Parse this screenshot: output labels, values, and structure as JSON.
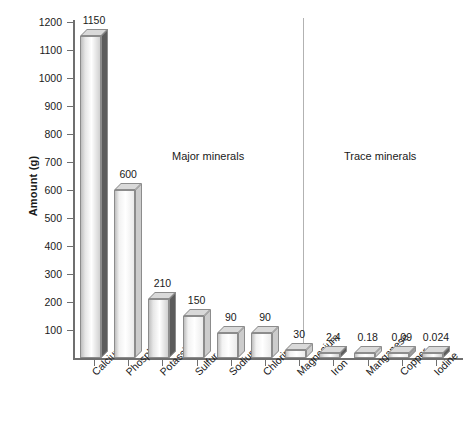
{
  "chart_data": {
    "type": "bar",
    "title": "",
    "subtitle": "",
    "xlabel": "",
    "ylabel": "Amount (g)",
    "ylim": [
      0,
      1200
    ],
    "yticks": [
      100,
      200,
      300,
      400,
      500,
      600,
      700,
      800,
      900,
      1000,
      1100,
      1200
    ],
    "ytick_labels": [
      "100",
      "200",
      "300",
      "400",
      "500",
      "600",
      "700",
      "800",
      "900",
      "1000",
      "1100",
      "1200"
    ],
    "grid": false,
    "legend": null,
    "categories": [
      "Calcium",
      "Phosphorus",
      "Potassium",
      "Sulfur",
      "Sodium",
      "Chlorine",
      "Magnesium",
      "Iron",
      "Manganese",
      "Copper",
      "Iodine"
    ],
    "values": [
      1150,
      600,
      210,
      150,
      90,
      90,
      30,
      2.4,
      0.18,
      0.09,
      0.024
    ],
    "value_labels": [
      "1150",
      "600",
      "210",
      "150",
      "90",
      "90",
      "30",
      "2.4",
      "0.18",
      "0.09",
      "0.024"
    ],
    "annotations": [
      {
        "text": "Major minerals",
        "covers": [
          "Calcium",
          "Phosphorus",
          "Potassium",
          "Sulfur",
          "Sodium",
          "Chlorine",
          "Magnesium"
        ]
      },
      {
        "text": "Trace minerals",
        "covers": [
          "Iron",
          "Manganese",
          "Copper",
          "Iodine"
        ]
      }
    ],
    "group_divider_after": "Magnesium"
  },
  "axis": {
    "y_title": "Amount (g)",
    "tick_labels": [
      "1200",
      "1100",
      "1000",
      "900",
      "800",
      "700",
      "600",
      "500",
      "400",
      "300",
      "200",
      "100"
    ]
  },
  "groups": {
    "major_label": "Major minerals",
    "trace_label": "Trace minerals"
  },
  "bars": [
    {
      "name": "Calcium",
      "value_label": "1150",
      "shade": "dark"
    },
    {
      "name": "Phosphorus",
      "value_label": "600",
      "shade": "light"
    },
    {
      "name": "Potassium",
      "value_label": "210",
      "shade": "dark"
    },
    {
      "name": "Sulfur",
      "value_label": "150",
      "shade": "light"
    },
    {
      "name": "Sodium",
      "value_label": "90",
      "shade": "light"
    },
    {
      "name": "Chlorine",
      "value_label": "90",
      "shade": "light"
    },
    {
      "name": "Magnesium",
      "value_label": "30",
      "shade": "light"
    },
    {
      "name": "Iron",
      "value_label": "2.4",
      "shade": "dark"
    },
    {
      "name": "Manganese",
      "value_label": "0.18",
      "shade": "light"
    },
    {
      "name": "Copper",
      "value_label": "0.09",
      "shade": "mid"
    },
    {
      "name": "Iodine",
      "value_label": "0.024",
      "shade": "dark"
    }
  ],
  "colors": {
    "axis": "#6f6f6f",
    "divider": "#b2b2b2",
    "bar_outline": "#8c8c8c",
    "bar_face_light": "#f2f2f2",
    "bar_face_dark": "#e6e6e6",
    "bar_top": "#d9d9d9",
    "bar_side_light": "#cccccc",
    "bar_side_dark": "#5c5c5c",
    "text": "#1a1a1a",
    "background": "#ffffff"
  }
}
